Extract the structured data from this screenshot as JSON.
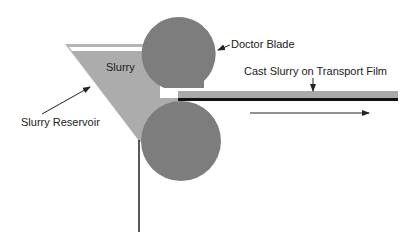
{
  "diagram": {
    "labels": {
      "slurry": "Slurry",
      "doctor_blade": "Doctor Blade",
      "cast_slurry": "Cast Slurry on Transport Film",
      "reservoir": "Slurry Reservoir"
    },
    "colors": {
      "roller": "#7d7d7d",
      "slurry": "#acacac",
      "film": "#111111",
      "background": "#ffffff"
    }
  }
}
